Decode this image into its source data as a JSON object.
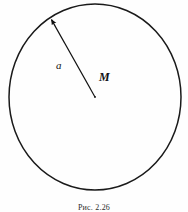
{
  "figure": {
    "caption": "Рис. 2.26",
    "background_color": "#fefefe",
    "stroke_color": "#1a1a1a",
    "labels": {
      "radius": "a",
      "center": "M"
    },
    "geometry": {
      "circle": {
        "cx": 95,
        "cy": 97,
        "rx": 86,
        "ry": 93,
        "stroke_width": 1.5
      },
      "radius_arrow": {
        "from_x": 95,
        "from_y": 97,
        "to_x": 50,
        "to_y": 17,
        "stroke_width": 1.2,
        "arrowhead": "filled-triangle"
      }
    }
  },
  "chart_data": {
    "type": "diagram",
    "title": "Рис. 2.26",
    "elements": [
      {
        "kind": "circle",
        "center_label": "M",
        "center": [
          95,
          97
        ],
        "semi_axis_x": 86,
        "semi_axis_y": 93
      },
      {
        "kind": "vector",
        "label": "a",
        "tail": [
          95,
          97
        ],
        "head": [
          50,
          17
        ],
        "points_outward": true
      }
    ]
  }
}
